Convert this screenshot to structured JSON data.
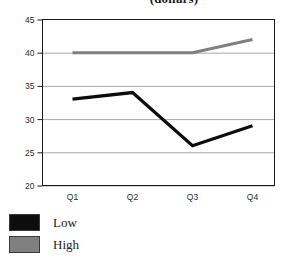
{
  "chart_data": {
    "type": "line",
    "title": "(dollars)",
    "xlabel": "",
    "ylabel": "",
    "categories": [
      "Q1",
      "Q2",
      "Q3",
      "Q4"
    ],
    "series": [
      {
        "name": "Low",
        "values": [
          33,
          34,
          26,
          29
        ],
        "color": "#0d0d0d"
      },
      {
        "name": "High",
        "values": [
          40,
          40,
          40,
          42
        ],
        "color": "#808080"
      }
    ],
    "ylim": [
      20,
      45
    ],
    "yticks": [
      20,
      25,
      30,
      35,
      40,
      45
    ],
    "ytick_labels": [
      "20",
      "25",
      "30",
      "35",
      "40",
      "45"
    ],
    "grid": true,
    "legend_position": "bottom-left"
  },
  "legend": {
    "items": [
      {
        "label": "Low",
        "color": "#0d0d0d"
      },
      {
        "label": "High",
        "color": "#808080"
      }
    ]
  },
  "colors": {
    "low_series": "#0d0d0d",
    "high_series": "#808080",
    "gridline": "#a8a8a8",
    "axis": "#1a1a1a",
    "background": "#ffffff"
  }
}
